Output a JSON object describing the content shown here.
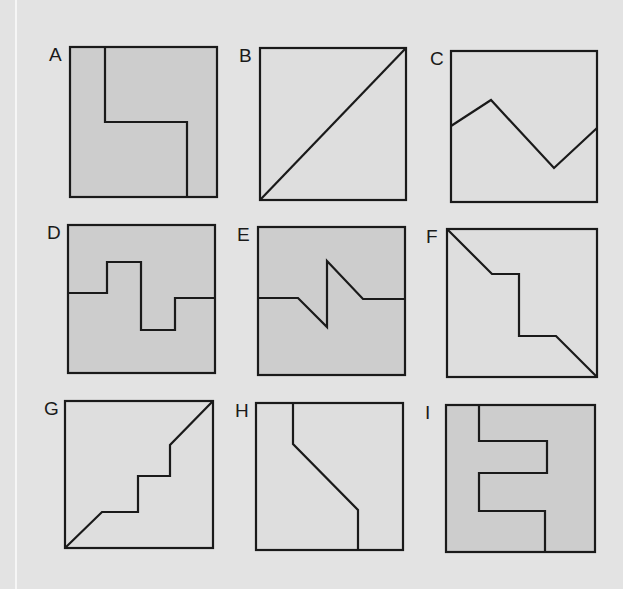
{
  "title_fragment": "",
  "colors": {
    "page_background": "#e3e3e3",
    "panel_light_fill": "#dedede",
    "panel_dark_fill": "#cdcdcd",
    "stroke": "#1a1a1a"
  },
  "panels": [
    {
      "label": "A",
      "fill": "dark",
      "box": [
        70,
        47,
        147,
        150
      ],
      "path": "M35 0 L35 75 L117 75 L117 150"
    },
    {
      "label": "B",
      "fill": "light",
      "box": [
        260,
        48,
        146,
        152
      ],
      "path": "M0 152 L146 0"
    },
    {
      "label": "C",
      "fill": "light",
      "box": [
        451,
        51,
        146,
        151
      ],
      "path": "M0 75 L40 49 L103 117 L146 77"
    },
    {
      "label": "D",
      "fill": "dark",
      "box": [
        68,
        225,
        147,
        148
      ],
      "path": "M0 68 L39 68 L39 37 L73 37 L73 105 L107 105 L107 73 L147 73"
    },
    {
      "label": "E",
      "fill": "dark",
      "box": [
        258,
        227,
        147,
        148
      ],
      "path": "M0 71 L40 71 L69 100 L69 34 L105 72 L147 72"
    },
    {
      "label": "F",
      "fill": "light",
      "box": [
        447,
        229,
        150,
        148
      ],
      "path": "M0 0 L45 45 L72 45 L72 107 L109 107 L150 148"
    },
    {
      "label": "G",
      "fill": "light",
      "box": [
        65,
        401,
        148,
        147
      ],
      "path": "M0 147 L37 111 L73 111 L73 75 L105 75 L105 44 L148 0"
    },
    {
      "label": "H",
      "fill": "light",
      "box": [
        256,
        403,
        147,
        147
      ],
      "path": "M37 0 L37 41 L102 107 L102 147"
    },
    {
      "label": "I",
      "fill": "dark",
      "box": [
        446,
        405,
        149,
        147
      ],
      "path": "M33 0 L33 36 L101 36 L101 68 L33 68 L33 106 L99 106 L99 147"
    }
  ]
}
